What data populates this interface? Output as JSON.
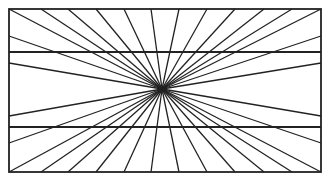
{
  "figure": {
    "name": "Hering illusion",
    "stroke_color": "#222222",
    "background": "#ffffff",
    "frame": {
      "x1": 9,
      "y1": 9,
      "x2": 321,
      "y2": 172
    },
    "center": {
      "x": 162,
      "y": 89
    },
    "parallel_lines_y": [
      52,
      127
    ],
    "ray_endpoints": [
      [
        9,
        9
      ],
      [
        41,
        9
      ],
      [
        68,
        9
      ],
      [
        96,
        9
      ],
      [
        124,
        9
      ],
      [
        151,
        9
      ],
      [
        179,
        9
      ],
      [
        207,
        9
      ],
      [
        235,
        9
      ],
      [
        264,
        9
      ],
      [
        292,
        9
      ],
      [
        321,
        9
      ],
      [
        9,
        36
      ],
      [
        9,
        63
      ],
      [
        321,
        36
      ],
      [
        321,
        63
      ],
      [
        9,
        116
      ],
      [
        9,
        143
      ],
      [
        321,
        116
      ],
      [
        321,
        143
      ],
      [
        9,
        172
      ],
      [
        41,
        172
      ],
      [
        68,
        172
      ],
      [
        96,
        172
      ],
      [
        124,
        172
      ],
      [
        151,
        172
      ],
      [
        179,
        172
      ],
      [
        207,
        172
      ],
      [
        235,
        172
      ],
      [
        264,
        172
      ],
      [
        292,
        172
      ],
      [
        321,
        172
      ]
    ]
  }
}
